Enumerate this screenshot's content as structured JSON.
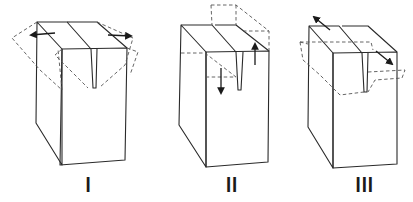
{
  "figure": {
    "panels": [
      {
        "id": "I",
        "label": "I",
        "motion": "opening (flaps pulled apart horizontally)"
      },
      {
        "id": "II",
        "label": "II",
        "motion": "sliding (flaps shifted vertically, opposite directions)"
      },
      {
        "id": "III",
        "label": "III",
        "motion": "tearing (flaps shifted out-of-plane, opposite directions)"
      }
    ],
    "colors": {
      "line": "#2a2a2a",
      "dashed": "#555555",
      "background": "#ffffff"
    }
  }
}
